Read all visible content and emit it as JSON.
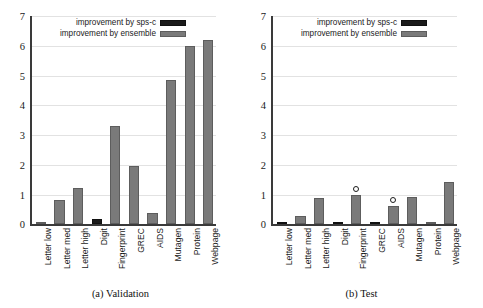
{
  "figure": {
    "panels": [
      {
        "id": "validation",
        "subcaption": "(a)  Validation"
      },
      {
        "id": "test",
        "subcaption": "(b)  Test"
      }
    ],
    "legend": {
      "position": "top-center",
      "entries": [
        {
          "label": "improvement by sps-c",
          "color": "#1b1b1b",
          "key": "sps_c"
        },
        {
          "label": "improvement by ensemble",
          "color": "#7a7a7a",
          "key": "ensemble"
        }
      ]
    }
  },
  "chart_data": [
    {
      "type": "bar",
      "id": "validation",
      "title": "(a)  Validation",
      "xlabel": "",
      "ylabel": "",
      "ylim": [
        0,
        7
      ],
      "yticks": [
        0,
        1,
        2,
        3,
        4,
        5,
        6,
        7
      ],
      "ytick_labels": [
        "0",
        "1",
        "2",
        "3",
        "4",
        "5",
        "6",
        "7"
      ],
      "grid": true,
      "categories": [
        "Letter low",
        "Letter med",
        "Letter high",
        "Digit",
        "Fingerprint",
        "GREC",
        "AIDS",
        "Mutagen",
        "Protein",
        "Webpage"
      ],
      "values": [
        0.02,
        0.82,
        1.22,
        0.18,
        3.3,
        1.95,
        0.4,
        4.85,
        6.0,
        6.2
      ],
      "bar_series": [
        "ensemble",
        "ensemble",
        "ensemble",
        "sps_c",
        "ensemble",
        "ensemble",
        "ensemble",
        "ensemble",
        "ensemble",
        "ensemble"
      ],
      "markers": []
    },
    {
      "type": "bar",
      "id": "test",
      "title": "(b)  Test",
      "xlabel": "",
      "ylabel": "",
      "ylim": [
        0,
        7
      ],
      "yticks": [
        0,
        1,
        2,
        3,
        4,
        5,
        6,
        7
      ],
      "ytick_labels": [
        "0",
        "1",
        "2",
        "3",
        "4",
        "5",
        "6",
        "7"
      ],
      "grid": true,
      "categories": [
        "Letter low",
        "Letter med",
        "Letter high",
        "Digit",
        "Fingerprint",
        "GREC",
        "AIDS",
        "Mutagen",
        "Protein",
        "Webpage"
      ],
      "values": [
        0.07,
        0.28,
        0.9,
        0.07,
        1.0,
        0.07,
        0.62,
        0.92,
        0.0,
        1.42
      ],
      "bar_series": [
        "sps_c",
        "ensemble",
        "ensemble",
        "sps_c",
        "ensemble",
        "sps_c",
        "ensemble",
        "ensemble",
        "ensemble",
        "ensemble"
      ],
      "markers": [
        {
          "category": "Fingerprint",
          "index": 4,
          "value": 1.2,
          "symbol": "open-circle"
        },
        {
          "category": "AIDS",
          "index": 6,
          "value": 0.82,
          "symbol": "open-circle"
        }
      ]
    }
  ]
}
